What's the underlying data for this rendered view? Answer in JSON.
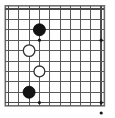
{
  "diagram": {
    "title": "Go board position diagram",
    "type": "go-board",
    "board": {
      "columns": 10,
      "rows": 10,
      "visible_grid_label": "10x10 partial goban grid",
      "origin_x": 8.5,
      "origin_y": 9.0,
      "spacing_x": 10.3,
      "spacing_y": 10.4,
      "line_color": "#5a5a5a",
      "border_color": "#4a4a4a",
      "outer_border_color": "#6e6e6e",
      "background_color": "#ffffff",
      "line_width": 1.0,
      "border_width": 1.6
    },
    "star_points": [
      {
        "name": "hoshi-c4-r4",
        "col": 4,
        "row": 4
      },
      {
        "name": "hoshi-c10-r4",
        "col": 10,
        "row": 4
      },
      {
        "name": "hoshi-c4-r10",
        "col": 4,
        "row": 10
      },
      {
        "name": "hoshi-c10-r10",
        "col": 10,
        "row": 10
      },
      {
        "name": "hoshi-c10-r11",
        "col": 10,
        "row": 11
      }
    ],
    "star_point_radius": 1.6,
    "star_point_color": "#1a1a1a",
    "stones": [
      {
        "name": "black-stone-upper",
        "color": "black",
        "fill": "#141414",
        "stroke": "#000000",
        "col": 4,
        "row": 3,
        "radius": 6.0,
        "label": ""
      },
      {
        "name": "white-stone-upper",
        "color": "white",
        "fill": "#ffffff",
        "stroke": "#333333",
        "col": 3,
        "row": 5,
        "radius": 5.8,
        "label": ""
      },
      {
        "name": "white-stone-lower",
        "color": "white",
        "fill": "#ffffff",
        "stroke": "#333333",
        "col": 4,
        "row": 7,
        "radius": 5.4,
        "label": ""
      },
      {
        "name": "black-stone-lower",
        "color": "black",
        "fill": "#141414",
        "stroke": "#000000",
        "col": 3,
        "row": 9,
        "radius": 6.0,
        "label": ""
      }
    ],
    "stone_count": {
      "black": 2,
      "white": 2,
      "total": 4
    }
  }
}
